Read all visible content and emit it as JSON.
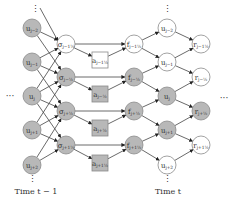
{
  "colors": {
    "gray_fill": "#b8b8b8",
    "white_fill": "#ffffff",
    "stroke": "#8a8a8a",
    "edge": "#444444"
  },
  "columns": {
    "u_prev": {
      "x": 32,
      "nodes": [
        {
          "label": "u",
          "sub": "j−2",
          "y": 28,
          "fill": "gray"
        },
        {
          "label": "u",
          "sub": "j−1",
          "y": 62,
          "fill": "gray"
        },
        {
          "label": "u",
          "sub": "j",
          "y": 96,
          "fill": "gray"
        },
        {
          "label": "u",
          "sub": "j+1",
          "y": 130,
          "fill": "gray"
        },
        {
          "label": "u",
          "sub": "j+2",
          "y": 165,
          "fill": "gray"
        }
      ]
    },
    "sigma": {
      "x": 66,
      "nodes": [
        {
          "label": "σ",
          "sub": "j−1½",
          "y": 44,
          "fill": "white"
        },
        {
          "label": "σ",
          "sub": "j−½",
          "y": 77,
          "fill": "gray"
        },
        {
          "label": "σ",
          "sub": "j+½",
          "y": 111,
          "fill": "gray"
        },
        {
          "label": "σ",
          "sub": "j+1½",
          "y": 145,
          "fill": "gray"
        }
      ]
    },
    "a_boxes": {
      "x": 100,
      "nodes": [
        {
          "label": "a",
          "sub": "j−1½",
          "y": 60,
          "fill": "white"
        },
        {
          "label": "a",
          "sub": "j−½",
          "y": 94,
          "fill": "gray"
        },
        {
          "label": "a",
          "sub": "j+½",
          "y": 128,
          "fill": "gray"
        },
        {
          "label": "a",
          "sub": "j+1½",
          "y": 163,
          "fill": "gray"
        }
      ]
    },
    "f": {
      "x": 134,
      "nodes": [
        {
          "label": "f",
          "sub": "j−1½",
          "y": 44,
          "fill": "white"
        },
        {
          "label": "f",
          "sub": "j−½",
          "y": 77,
          "fill": "gray"
        },
        {
          "label": "f",
          "sub": "j+½",
          "y": 111,
          "fill": "gray"
        },
        {
          "label": "f",
          "sub": "j+1½",
          "y": 145,
          "fill": "gray"
        }
      ]
    },
    "u_next": {
      "x": 167,
      "nodes": [
        {
          "label": "u",
          "sub": "j−2",
          "y": 28,
          "fill": "white"
        },
        {
          "label": "u",
          "sub": "j−1",
          "y": 62,
          "fill": "white"
        },
        {
          "label": "u",
          "sub": "j",
          "y": 96,
          "fill": "gray"
        },
        {
          "label": "u",
          "sub": "j+1",
          "y": 130,
          "fill": "gray"
        },
        {
          "label": "u",
          "sub": "j+2",
          "y": 165,
          "fill": "white"
        }
      ]
    },
    "r": {
      "x": 201,
      "nodes": [
        {
          "label": "r",
          "sub": "j−1½",
          "y": 44,
          "fill": "white"
        },
        {
          "label": "r",
          "sub": "j−½",
          "y": 77,
          "fill": "white"
        },
        {
          "label": "r",
          "sub": "j+½",
          "y": 111,
          "fill": "gray"
        },
        {
          "label": "r",
          "sub": "j+1½",
          "y": 145,
          "fill": "white"
        }
      ]
    }
  },
  "labels": {
    "time_prev": "Time t − 1",
    "time_next": "Time t",
    "ellipsis_h": "···",
    "ellipsis_v": "⋮"
  }
}
